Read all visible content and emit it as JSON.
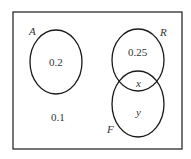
{
  "diagram": {
    "type": "venn",
    "sets": [
      {
        "name": "A",
        "value": "0.2"
      },
      {
        "name": "R",
        "value": "0.25"
      },
      {
        "name": "F",
        "value": "y"
      }
    ],
    "intersection_RF": "x",
    "outside": "0.1",
    "colors": {
      "stroke": "#1a1a1a",
      "text": "#333333",
      "background": "#ffffff"
    }
  }
}
